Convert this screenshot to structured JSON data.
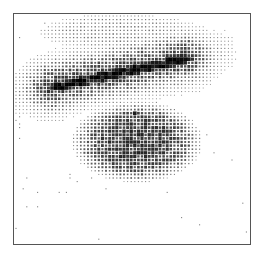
{
  "image": {
    "description": "Halftone dot-density image inside a rectangular frame",
    "frame": {
      "x": 13,
      "y": 13,
      "width": 238,
      "height": 232,
      "stroke": "#555555"
    },
    "dot_color": "#111111",
    "dot_pitch": 3.6
  },
  "density_regions": [
    {
      "name": "diagonal-band-core",
      "type": "line",
      "x1": 40,
      "y1": 90,
      "x2": 200,
      "y2": 56,
      "width": 4,
      "peak": 1.0
    },
    {
      "name": "diagonal-band-halo",
      "type": "line",
      "x1": 22,
      "y1": 92,
      "x2": 215,
      "y2": 52,
      "width": 16,
      "peak": 0.55
    },
    {
      "name": "lower-blob",
      "type": "ellipse",
      "cx": 137,
      "cy": 142,
      "rx": 68,
      "ry": 42,
      "peak": 0.6
    },
    {
      "name": "dark-spot",
      "type": "ellipse",
      "cx": 135,
      "cy": 114,
      "rx": 4,
      "ry": 3,
      "peak": 1.0
    },
    {
      "name": "upper-scatter",
      "type": "ellipse",
      "cx": 120,
      "cy": 32,
      "rx": 90,
      "ry": 20,
      "peak": 0.18
    },
    {
      "name": "left-scatter",
      "type": "ellipse",
      "cx": 45,
      "cy": 100,
      "rx": 30,
      "ry": 25,
      "peak": 0.15
    }
  ]
}
